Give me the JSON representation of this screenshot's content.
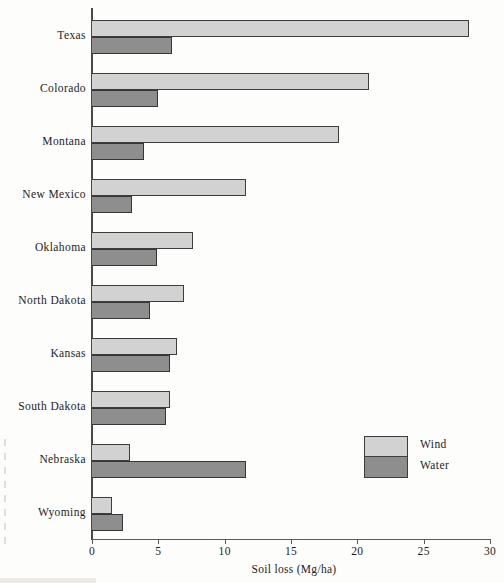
{
  "chart_data": {
    "type": "bar",
    "orientation": "horizontal",
    "title": "",
    "xlabel": "Soil loss (Mg/ha)",
    "ylabel": "",
    "xlim": [
      0,
      30
    ],
    "xticks": [
      0,
      5,
      10,
      15,
      20,
      25,
      30
    ],
    "xtick_labels": [
      "0",
      "5",
      "10",
      "15",
      "20",
      "25",
      "30"
    ],
    "grid": false,
    "legend_position": "center-right",
    "categories": [
      "Texas",
      "Colorado",
      "Montana",
      "New Mexico",
      "Oklahoma",
      "North Dakota",
      "Kansas",
      "South Dakota",
      "Nebraska",
      "Wyoming"
    ],
    "series": [
      {
        "name": "Wind",
        "color": "#d2d2d2",
        "values": [
          28.4,
          20.9,
          18.6,
          11.6,
          7.6,
          6.9,
          6.4,
          5.9,
          2.9,
          1.5
        ]
      },
      {
        "name": "Water",
        "color": "#8e8e8e",
        "values": [
          6.0,
          5.0,
          3.9,
          3.0,
          4.9,
          4.4,
          5.9,
          5.6,
          11.6,
          2.3
        ]
      }
    ]
  },
  "legend": {
    "entries": [
      {
        "label": "Wind",
        "color": "#d2d2d2"
      },
      {
        "label": "Water",
        "color": "#8e8e8e"
      }
    ]
  },
  "axis": {
    "x_title": "Soil loss (Mg/ha)"
  }
}
